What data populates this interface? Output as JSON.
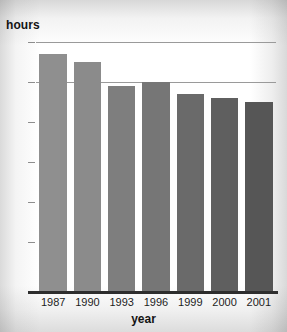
{
  "chart_data": {
    "type": "bar",
    "title": "",
    "xlabel": "year",
    "ylabel": "hours",
    "categories": [
      "1987",
      "1990",
      "1993",
      "1996",
      "1999",
      "2000",
      "2001"
    ],
    "values": [
      47,
      45,
      39,
      40,
      37,
      36,
      35
    ],
    "bar_colors": [
      "#8f8f8f",
      "#8b8b8b",
      "#7e7e7e",
      "#767676",
      "#6a6a6a",
      "#5f5f5f",
      "#565656"
    ],
    "ylim": [
      0,
      50
    ],
    "yticks": [
      0,
      10,
      20,
      30,
      40,
      50
    ],
    "ytick_labels": [
      "0",
      "10",
      "20",
      "30",
      "40",
      "50"
    ],
    "grid": true,
    "gridlines_at": [
      40,
      50
    ],
    "legend": "none",
    "legend_position": "none"
  },
  "axes": {
    "y_title": "hours",
    "x_title": "year"
  },
  "colors": {
    "gridline": "#9a9a9a",
    "axis": "#2e2e2e",
    "text": "#141414"
  }
}
